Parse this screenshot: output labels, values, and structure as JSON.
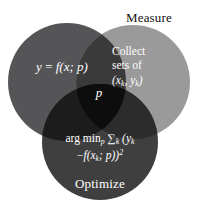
{
  "diagram": {
    "type": "venn-3-circle",
    "background_color": "#ffffff",
    "circles": [
      {
        "id": "model",
        "label": "Model",
        "label_color": "#ffffff",
        "fill_color": "#555557",
        "cx": 67,
        "cy": 82,
        "r": 59
      },
      {
        "id": "measure",
        "label": "Measure",
        "label_color": "#111111",
        "fill_color": "#9a9a9a",
        "cx": 133,
        "cy": 82,
        "r": 57
      },
      {
        "id": "optimize",
        "label": "Optimize",
        "label_color": "#ffffff",
        "fill_color": "#3f3f3f",
        "cx": 100,
        "cy": 142,
        "r": 58
      }
    ],
    "overlaps": {
      "model_measure": "#3a3a3a",
      "model_optimize": "#1c1c1c",
      "measure_optimize": "#2c2c2c",
      "center": "#0d0d0d"
    },
    "center_label": "p",
    "center_label_color": "#ffffff"
  },
  "model": {
    "title": "Model",
    "formula_lhs": "y",
    "formula_eq": "=",
    "formula_fn": "f",
    "formula_args": "(x; p)"
  },
  "measure": {
    "title": "Measure",
    "line1": "Collect",
    "line2": "sets of",
    "line3_open": "(x",
    "line3_sub1": "k",
    "line3_comma": ", y",
    "line3_sub2": "k",
    "line3_close": ")"
  },
  "optimize": {
    "title": "Optimize",
    "formula_line1_argmin": "arg min",
    "formula_line1_argmin_sub": "p",
    "formula_line1_sum": "∑",
    "formula_line1_sum_sub": "k",
    "formula_line1_open": "(y",
    "formula_line1_sub": "k",
    "formula_line2_minus": "−",
    "formula_line2_fn": "f",
    "formula_line2_args": "(x",
    "formula_line2_sub": "k",
    "formula_line2_tail": "; p))",
    "formula_line2_sup": "2"
  },
  "center": {
    "label": "p"
  }
}
